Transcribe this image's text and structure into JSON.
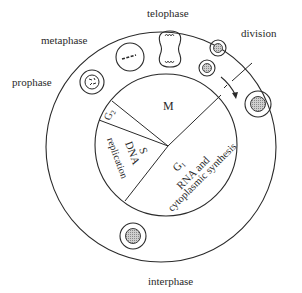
{
  "diagram": {
    "outer_labels": {
      "prophase": "prophase",
      "metaphase": "metaphase",
      "telophase": "telophase",
      "division": "division",
      "interphase": "interphase"
    },
    "sectors": {
      "m": {
        "label": "M"
      },
      "g2": {
        "label": "G",
        "sub": "2"
      },
      "s": {
        "label": "S",
        "desc": "DNA",
        "desc2": "replication"
      },
      "g1": {
        "label": "G",
        "sub": "1",
        "desc": "RNA and",
        "desc2": "cytoplasmic synthesis"
      }
    },
    "colors": {
      "line": "#2a2a2a",
      "nucleus_fill": "#b8b8b8",
      "background": "#ffffff"
    }
  }
}
